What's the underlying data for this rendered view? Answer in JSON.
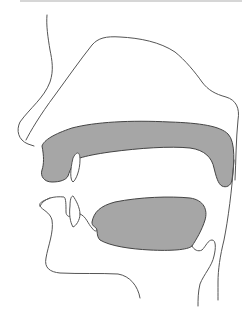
{
  "diagram": {
    "title": "Sagittal section of the human vocal tract",
    "colors": {
      "background": "#ffffff",
      "line": "#555555",
      "fill": "#a6a6a6",
      "fill_stroke": "#444444",
      "top_border": "#d6d6d6"
    },
    "parts": [
      {
        "id": "face-profile",
        "label": "Face profile (forehead, nose, lips, chin)"
      },
      {
        "id": "nasal-cavity",
        "label": "Nasal cavity outline"
      },
      {
        "id": "hard-palate",
        "label": "Palate (shaded)"
      },
      {
        "id": "upper-teeth",
        "label": "Upper incisor"
      },
      {
        "id": "lower-teeth",
        "label": "Lower incisors"
      },
      {
        "id": "tongue",
        "label": "Tongue (shaded)"
      },
      {
        "id": "epiglottis",
        "label": "Epiglottis"
      },
      {
        "id": "pharynx-wall",
        "label": "Pharyngeal wall"
      },
      {
        "id": "jaw",
        "label": "Lower jaw / neck"
      }
    ]
  }
}
